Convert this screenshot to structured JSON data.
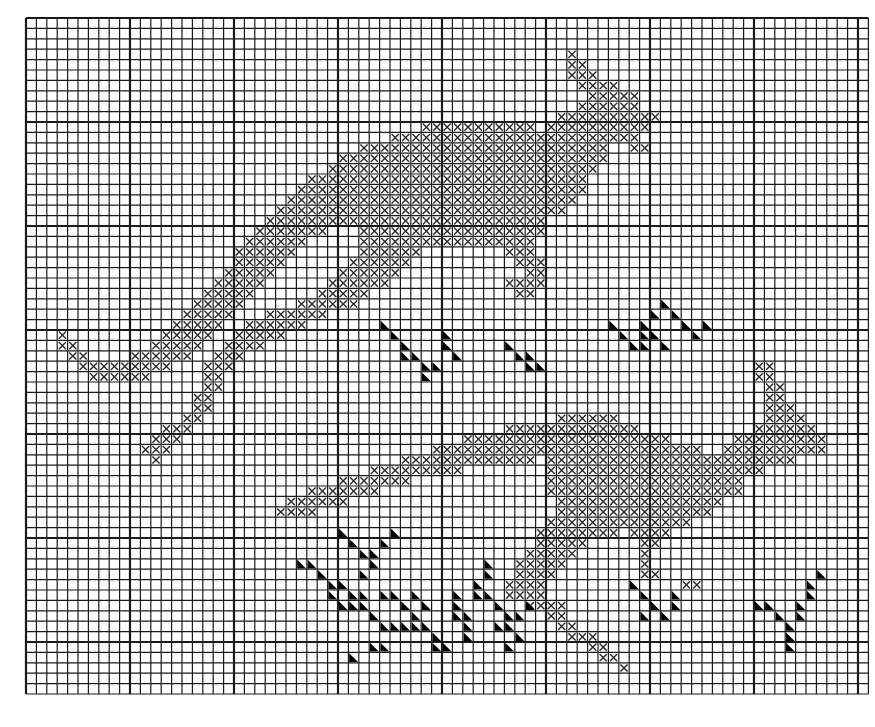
{
  "title": "Kangaroo cross-stitch chart",
  "grid": {
    "origin_x": 26,
    "origin_y": 18,
    "cell": 10.4,
    "cols": 81,
    "rows": 65,
    "heavy_every": 10,
    "line_color": "#1a1a1a",
    "background": "#ffffff"
  },
  "legend": {
    "cross_symbol": "cross-stitch",
    "triangle_symbol": "half-filled-triangle"
  },
  "colors": {
    "cross": "#2a2a2a",
    "triangle": "#000000"
  },
  "kangaroo_top": {
    "name": "upper kangaroo",
    "runs": [
      [
        3,
        [
          [
            52,
            52
          ]
        ]
      ],
      [
        4,
        [
          [
            52,
            53
          ]
        ]
      ],
      [
        5,
        [
          [
            52,
            54
          ]
        ]
      ],
      [
        6,
        [
          [
            53,
            56
          ]
        ]
      ],
      [
        7,
        [
          [
            54,
            58
          ]
        ]
      ],
      [
        8,
        [
          [
            53,
            58
          ]
        ]
      ],
      [
        9,
        [
          [
            51,
            60
          ]
        ]
      ],
      [
        10,
        [
          [
            38,
            48
          ],
          [
            50,
            59
          ]
        ]
      ],
      [
        11,
        [
          [
            35,
            58
          ]
        ]
      ],
      [
        12,
        [
          [
            32,
            55
          ],
          [
            58,
            59
          ]
        ]
      ],
      [
        13,
        [
          [
            30,
            55
          ]
        ]
      ],
      [
        14,
        [
          [
            29,
            54
          ]
        ]
      ],
      [
        15,
        [
          [
            27,
            53
          ]
        ]
      ],
      [
        16,
        [
          [
            26,
            53
          ]
        ]
      ],
      [
        17,
        [
          [
            25,
            52
          ]
        ]
      ],
      [
        18,
        [
          [
            24,
            51
          ]
        ]
      ],
      [
        19,
        [
          [
            23,
            49
          ]
        ]
      ],
      [
        20,
        [
          [
            22,
            28
          ],
          [
            32,
            49
          ]
        ]
      ],
      [
        21,
        [
          [
            21,
            26
          ],
          [
            32,
            48
          ]
        ]
      ],
      [
        22,
        [
          [
            20,
            25
          ],
          [
            32,
            37
          ],
          [
            46,
            48
          ]
        ]
      ],
      [
        23,
        [
          [
            20,
            24
          ],
          [
            31,
            36
          ],
          [
            47,
            49
          ]
        ]
      ],
      [
        24,
        [
          [
            19,
            23
          ],
          [
            30,
            35
          ],
          [
            48,
            49
          ]
        ]
      ],
      [
        25,
        [
          [
            18,
            22
          ],
          [
            29,
            34
          ],
          [
            46,
            49
          ]
        ]
      ],
      [
        26,
        [
          [
            17,
            21
          ],
          [
            28,
            32
          ],
          [
            47,
            48
          ]
        ]
      ],
      [
        27,
        [
          [
            16,
            20
          ],
          [
            26,
            31
          ]
        ]
      ],
      [
        28,
        [
          [
            15,
            19
          ],
          [
            23,
            28
          ]
        ]
      ],
      [
        29,
        [
          [
            14,
            18
          ],
          [
            21,
            26
          ]
        ]
      ],
      [
        30,
        [
          [
            3,
            3
          ],
          [
            13,
            17
          ],
          [
            20,
            24
          ]
        ]
      ],
      [
        31,
        [
          [
            3,
            4
          ],
          [
            12,
            16
          ],
          [
            19,
            22
          ]
        ]
      ],
      [
        32,
        [
          [
            4,
            5
          ],
          [
            10,
            15
          ],
          [
            18,
            20
          ]
        ]
      ],
      [
        33,
        [
          [
            5,
            13
          ],
          [
            17,
            19
          ]
        ]
      ],
      [
        34,
        [
          [
            6,
            11
          ],
          [
            17,
            18
          ]
        ]
      ],
      [
        35,
        [
          [
            17,
            18
          ]
        ]
      ],
      [
        36,
        [
          [
            16,
            17
          ]
        ]
      ],
      [
        37,
        [
          [
            16,
            17
          ]
        ]
      ],
      [
        38,
        [
          [
            15,
            16
          ]
        ]
      ],
      [
        39,
        [
          [
            13,
            15
          ]
        ]
      ],
      [
        40,
        [
          [
            12,
            14
          ]
        ]
      ],
      [
        41,
        [
          [
            11,
            13
          ]
        ]
      ],
      [
        42,
        [
          [
            12,
            12
          ]
        ]
      ]
    ]
  },
  "kangaroo_bottom": {
    "name": "lower kangaroo",
    "runs": [
      [
        33,
        [
          [
            70,
            71
          ]
        ]
      ],
      [
        34,
        [
          [
            70,
            71
          ]
        ]
      ],
      [
        35,
        [
          [
            71,
            72
          ]
        ]
      ],
      [
        36,
        [
          [
            71,
            72
          ]
        ]
      ],
      [
        37,
        [
          [
            71,
            73
          ]
        ]
      ],
      [
        38,
        [
          [
            51,
            56
          ],
          [
            71,
            74
          ]
        ]
      ],
      [
        39,
        [
          [
            46,
            58
          ],
          [
            70,
            75
          ]
        ]
      ],
      [
        40,
        [
          [
            42,
            61
          ],
          [
            68,
            76
          ]
        ]
      ],
      [
        41,
        [
          [
            39,
            64
          ],
          [
            67,
            76
          ]
        ]
      ],
      [
        42,
        [
          [
            36,
            48
          ],
          [
            50,
            73
          ]
        ]
      ],
      [
        43,
        [
          [
            33,
            41
          ],
          [
            50,
            70
          ]
        ]
      ],
      [
        44,
        [
          [
            30,
            36
          ],
          [
            50,
            68
          ]
        ]
      ],
      [
        45,
        [
          [
            27,
            33
          ],
          [
            50,
            68
          ]
        ]
      ],
      [
        46,
        [
          [
            25,
            30
          ],
          [
            51,
            66
          ]
        ]
      ],
      [
        47,
        [
          [
            24,
            27
          ],
          [
            51,
            65
          ]
        ]
      ],
      [
        48,
        [
          [
            50,
            63
          ]
        ]
      ],
      [
        49,
        [
          [
            49,
            56
          ],
          [
            58,
            61
          ]
        ]
      ],
      [
        50,
        [
          [
            49,
            53
          ],
          [
            59,
            60
          ]
        ]
      ],
      [
        51,
        [
          [
            48,
            52
          ],
          [
            59,
            59
          ]
        ]
      ],
      [
        52,
        [
          [
            47,
            51
          ],
          [
            59,
            59
          ]
        ]
      ],
      [
        53,
        [
          [
            47,
            50
          ],
          [
            59,
            60
          ]
        ]
      ],
      [
        54,
        [
          [
            46,
            49
          ],
          [
            63,
            64
          ]
        ]
      ],
      [
        55,
        [
          [
            46,
            49
          ]
        ]
      ],
      [
        56,
        [
          [
            48,
            51
          ]
        ]
      ],
      [
        57,
        [
          [
            50,
            51
          ]
        ]
      ],
      [
        58,
        [
          [
            51,
            52
          ]
        ]
      ],
      [
        59,
        [
          [
            52,
            54
          ]
        ]
      ],
      [
        60,
        [
          [
            54,
            55
          ]
        ]
      ],
      [
        61,
        [
          [
            55,
            56
          ]
        ]
      ],
      [
        62,
        [
          [
            57,
            57
          ]
        ]
      ]
    ]
  },
  "grass_marks": [
    [
      34,
      29
    ],
    [
      35,
      30
    ],
    [
      36,
      31
    ],
    [
      36,
      32
    ],
    [
      37,
      32
    ],
    [
      38,
      33
    ],
    [
      38,
      34
    ],
    [
      39,
      33
    ],
    [
      40,
      31
    ],
    [
      41,
      32
    ],
    [
      40,
      30
    ],
    [
      46,
      31
    ],
    [
      47,
      32
    ],
    [
      48,
      33
    ],
    [
      48,
      32
    ],
    [
      49,
      33
    ],
    [
      56,
      29
    ],
    [
      57,
      30
    ],
    [
      59,
      29
    ],
    [
      59,
      30
    ],
    [
      58,
      31
    ],
    [
      59,
      31
    ],
    [
      60,
      30
    ],
    [
      61,
      31
    ],
    [
      62,
      28
    ],
    [
      63,
      29
    ],
    [
      61,
      27
    ],
    [
      60,
      28
    ],
    [
      64,
      30
    ],
    [
      65,
      29
    ],
    [
      26,
      52
    ],
    [
      27,
      52
    ],
    [
      28,
      53
    ],
    [
      29,
      54
    ],
    [
      29,
      55
    ],
    [
      30,
      54
    ],
    [
      30,
      56
    ],
    [
      31,
      55
    ],
    [
      31,
      56
    ],
    [
      32,
      55
    ],
    [
      30,
      49
    ],
    [
      31,
      50
    ],
    [
      32,
      51
    ],
    [
      32,
      53
    ],
    [
      33,
      52
    ],
    [
      33,
      51
    ],
    [
      34,
      50
    ],
    [
      35,
      49
    ],
    [
      32,
      56
    ],
    [
      33,
      57
    ],
    [
      34,
      58
    ],
    [
      35,
      58
    ],
    [
      36,
      58
    ],
    [
      37,
      58
    ],
    [
      38,
      58
    ],
    [
      39,
      59
    ],
    [
      39,
      60
    ],
    [
      40,
      60
    ],
    [
      37,
      55
    ],
    [
      38,
      56
    ],
    [
      34,
      55
    ],
    [
      35,
      55
    ],
    [
      36,
      56
    ],
    [
      37,
      57
    ],
    [
      33,
      60
    ],
    [
      34,
      60
    ],
    [
      31,
      61
    ],
    [
      41,
      55
    ],
    [
      41,
      56
    ],
    [
      41,
      57
    ],
    [
      42,
      57
    ],
    [
      42,
      58
    ],
    [
      42,
      59
    ],
    [
      44,
      52
    ],
    [
      44,
      53
    ],
    [
      43,
      54
    ],
    [
      43,
      55
    ],
    [
      44,
      55
    ],
    [
      45,
      56
    ],
    [
      46,
      57
    ],
    [
      45,
      58
    ],
    [
      46,
      58
    ],
    [
      47,
      59
    ],
    [
      46,
      60
    ],
    [
      47,
      57
    ],
    [
      48,
      56
    ],
    [
      58,
      54
    ],
    [
      59,
      55
    ],
    [
      60,
      56
    ],
    [
      59,
      57
    ],
    [
      61,
      57
    ],
    [
      62,
      55
    ],
    [
      62,
      56
    ],
    [
      70,
      56
    ],
    [
      71,
      56
    ],
    [
      72,
      57
    ],
    [
      73,
      58
    ],
    [
      73,
      59
    ],
    [
      74,
      56
    ],
    [
      74,
      57
    ],
    [
      75,
      55
    ],
    [
      75,
      54
    ],
    [
      76,
      53
    ],
    [
      73,
      60
    ]
  ]
}
